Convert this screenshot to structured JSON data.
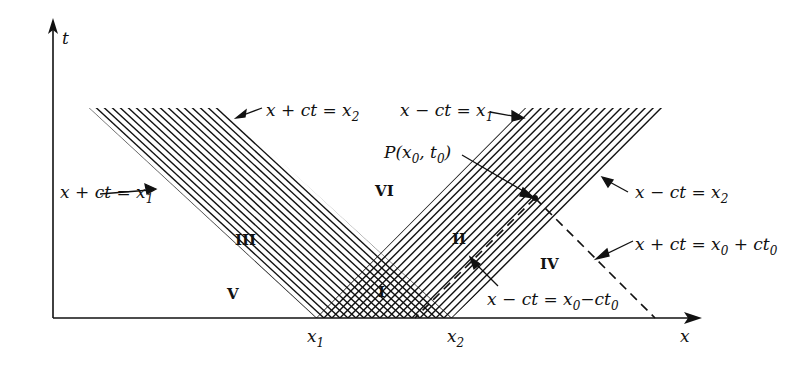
{
  "figure": {
    "type": "characteristics-diagram",
    "axes": {
      "t_label": "t",
      "x_label": "x",
      "tick_x1": "x",
      "tick_x1_sub": "1",
      "tick_x2": "x",
      "tick_x2_sub": "2"
    },
    "regions": {
      "I": "I",
      "II": "II",
      "III": "III",
      "IV": "IV",
      "V": "V",
      "VI": "VI"
    },
    "annotations": {
      "left_upper": {
        "main": "x + ct = x",
        "sub": "2"
      },
      "left_lower": {
        "main": "x + ct = x",
        "sub": "1"
      },
      "right_upper": {
        "main": "x − ct = x",
        "sub": "1"
      },
      "right_lower": {
        "main": "x − ct = x",
        "sub": "2"
      },
      "point": {
        "text": "P(x",
        "sub1": "0",
        "mid": ", t",
        "sub2": "0",
        "end": ")"
      },
      "dashed_right": {
        "a": "x + ct = x",
        "s1": "0",
        "b": " + ct",
        "s2": "0"
      },
      "dashed_left": {
        "a": "x − ct = x",
        "s1": "0",
        "b": "−ct",
        "s2": "0"
      }
    },
    "colors": {
      "ink": "#111111",
      "background": "#ffffff"
    }
  }
}
